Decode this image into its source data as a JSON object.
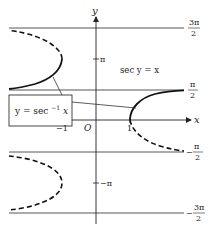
{
  "diagram": {
    "axes": {
      "x_label": "x",
      "y_label": "y",
      "origin_label": "O",
      "x_ticks": [
        {
          "label": "1",
          "value": 1
        },
        {
          "label": "−1",
          "value": -1
        }
      ],
      "y_ticks": [
        {
          "label": "π",
          "value": "pi"
        },
        {
          "label": "−π",
          "value": "-pi"
        }
      ]
    },
    "asymptotes": [
      {
        "num": "3π",
        "den": "2",
        "sign": "",
        "value": "3pi/2"
      },
      {
        "num": "π",
        "den": "2",
        "sign": "",
        "value": "pi/2"
      },
      {
        "num": "π",
        "den": "2",
        "sign": "−",
        "value": "-pi/2"
      },
      {
        "num": "3π",
        "den": "2",
        "sign": "−",
        "value": "-3pi/2"
      }
    ],
    "annotations": {
      "relation": "sec y = x",
      "callout": {
        "prefix": "y = sec",
        "sup": "−1",
        "suffix": " x"
      }
    },
    "colors": {
      "curve": "#111111",
      "line": "#333333",
      "text": "#222222"
    }
  }
}
